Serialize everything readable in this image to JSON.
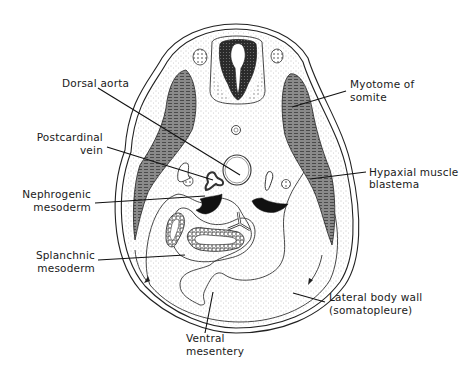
{
  "figure": {
    "type": "diagram",
    "labels": {
      "dorsal_aorta": "Dorsal aorta",
      "postcardinal_vein_line1": "Postcardinal",
      "postcardinal_vein_line2": "vein",
      "nephrogenic_line1": "Nephrogenic",
      "nephrogenic_line2": "mesoderm",
      "splanchnic_line1": "Splanchnic",
      "splanchnic_line2": "mesoderm",
      "ventral_mesentery_line1": "Ventral",
      "ventral_mesentery_line2": "mesentery",
      "myotome_line1": "Myotome of",
      "myotome_line2": "somite",
      "hypaxial_line1": "Hypaxial muscle",
      "hypaxial_line2": "blastema",
      "lateral_body_wall_line1": "Lateral body wall",
      "lateral_body_wall_line2": "(somatopleure)"
    },
    "colors": {
      "ink": "#111111",
      "muscle_fill": "#7a7a7a",
      "background": "#ffffff"
    }
  }
}
